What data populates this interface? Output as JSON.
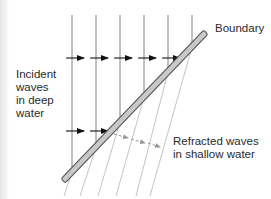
{
  "figure": {
    "labels": {
      "incident": "Incident\nwaves\nin deep\nwater",
      "boundary": "Boundary",
      "refracted": "Refracted waves\nin shallow water"
    },
    "colors": {
      "incident_line": "#8a8a8a",
      "arrow": "#111111",
      "boundary_fill": "#c8c8c8",
      "boundary_stroke": "#555555",
      "refracted_line": "#bdbdbd",
      "refracted_arrow": "#9a9a9a",
      "text": "#2a2a2a"
    },
    "incident_wave_x": [
      72,
      96,
      120,
      144,
      168,
      192
    ],
    "incident_arrow_rows_y": [
      58,
      131
    ],
    "refracted_waves_count": 6
  }
}
